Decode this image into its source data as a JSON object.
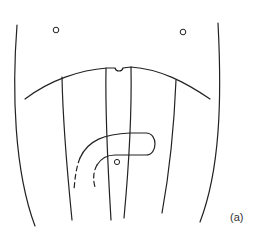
{
  "figure": {
    "panel_label": "(a)",
    "line_color": "#222222",
    "background": "#ffffff",
    "elements": [
      "left-outer-curve",
      "right-outer-curve",
      "transverse-arc-with-notch",
      "longitudinal-line-1",
      "longitudinal-line-2",
      "longitudinal-line-3",
      "longitudinal-line-4",
      "hook-shaped-loop",
      "dashed-continuations",
      "small-circle-upper-left",
      "small-circle-upper-right",
      "small-circle-center"
    ]
  }
}
